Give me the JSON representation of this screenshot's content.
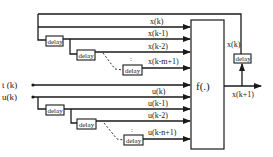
{
  "diagram": {
    "block_label": "f(.)",
    "inputs": {
      "t": "t (k)",
      "u": "u(k)"
    },
    "state_signals": [
      "x(k)",
      "x(k-1)",
      "x(k-2)",
      "x(k-m+1)"
    ],
    "input_signals": [
      "u(k)",
      "u(k-1)",
      "u(k-2)",
      "u(k-n+1)"
    ],
    "delay_label": "delay",
    "ellipsis": ":",
    "feedback_label": "x(k)",
    "output_label": "x(k+1)"
  }
}
